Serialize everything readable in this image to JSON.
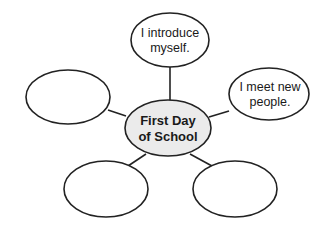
{
  "diagram": {
    "type": "web-graphic-organizer",
    "center": {
      "lines": [
        "First Day",
        "of School"
      ],
      "fill": "#ebebeb"
    },
    "nodes": [
      {
        "id": "top",
        "lines": [
          "I introduce",
          "myself."
        ]
      },
      {
        "id": "right",
        "lines": [
          "I meet new",
          "people."
        ]
      },
      {
        "id": "left",
        "lines": []
      },
      {
        "id": "bottom-left",
        "lines": []
      },
      {
        "id": "bottom-right",
        "lines": []
      }
    ],
    "stroke_color": "#222222"
  }
}
